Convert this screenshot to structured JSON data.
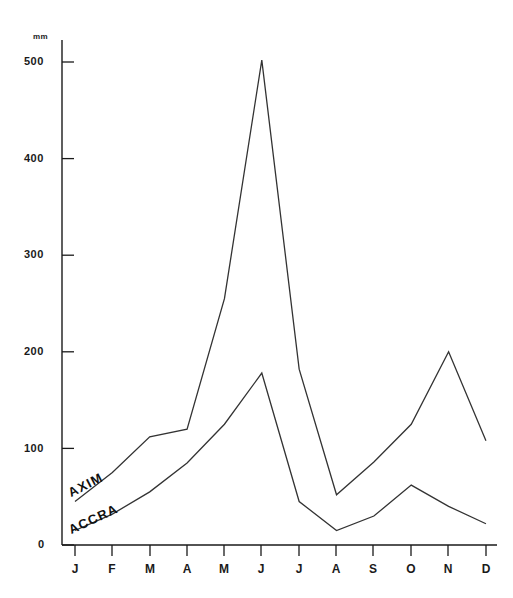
{
  "chart_data": {
    "type": "line",
    "title": "",
    "xlabel": "",
    "ylabel": "mm",
    "categories": [
      "J",
      "F",
      "M",
      "A",
      "M",
      "J",
      "J",
      "A",
      "S",
      "O",
      "N",
      "D"
    ],
    "category_names": [
      "January",
      "February",
      "March",
      "April",
      "May",
      "June",
      "July",
      "August",
      "September",
      "October",
      "November",
      "December"
    ],
    "ylim": [
      0,
      530
    ],
    "yticks": [
      0,
      100,
      200,
      300,
      400,
      500
    ],
    "ytick_labels": [
      "0",
      "100",
      "200",
      "300",
      "400",
      "500"
    ],
    "grid": false,
    "legend_position": "inline-along-curves",
    "series": [
      {
        "name": "AXIM",
        "label_text": "AXIM",
        "values": [
          45,
          75,
          112,
          120,
          255,
          502,
          182,
          52,
          86,
          125,
          200,
          108
        ]
      },
      {
        "name": "ACCRA",
        "label_text": "ACCRA",
        "values": [
          15,
          32,
          55,
          85,
          125,
          178,
          45,
          15,
          30,
          62,
          40,
          22
        ]
      }
    ],
    "colors": {
      "line": "#333333",
      "axis": "#1a1a1a",
      "text": "#1a1a1a",
      "background": "#ffffff"
    }
  },
  "axis": {
    "y_unit_label": "mm"
  }
}
